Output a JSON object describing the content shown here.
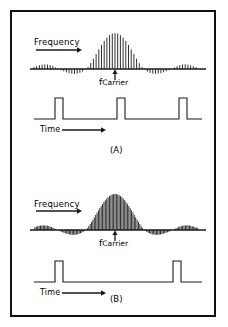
{
  "figure": {
    "border_color": "#111111",
    "trace_color": "#1a1a1a",
    "background": "#ffffff"
  },
  "panels": [
    {
      "tag": "(A)",
      "frequency_label": "Frequency",
      "time_label": "Time",
      "carrier_symbol": "f",
      "carrier_subscript": "Carrier",
      "chart_data": {
        "type": "line",
        "title": "(A) Short pulse period spectrum",
        "xlabel": "Frequency",
        "ylabel": "",
        "subcharts": [
          {
            "type": "bar",
            "name": "spectrum",
            "description": "Spectral line comb with sinc envelope centered on f Carrier",
            "line_count": 61,
            "line_spacing_px": 2.7,
            "main_lobe_peak": 1.0,
            "side_lobe_peak": -0.36,
            "envelope": "sinc",
            "baseline_y": 57,
            "carrier_x": 103,
            "x_start": 22,
            "x_end": 188
          },
          {
            "type": "line",
            "name": "pulse-train",
            "description": "Rectangular pulse train, narrow pulses, short period",
            "pulse_count": 3,
            "pulse_width_px": 8,
            "pulse_period_px": 62,
            "pulse_positions": [
              47,
              109,
              171
            ],
            "baseline_y": 107,
            "top_y": 86,
            "x_start": 22,
            "x_end": 190
          }
        ]
      }
    },
    {
      "tag": "(B)",
      "frequency_label": "Frequency",
      "time_label": "Time",
      "carrier_symbol": "f",
      "carrier_subscript": "Carrier",
      "chart_data": {
        "type": "line",
        "title": "(B) Long pulse period spectrum",
        "xlabel": "Frequency",
        "ylabel": "",
        "subcharts": [
          {
            "type": "bar",
            "name": "spectrum",
            "description": "Denser spectral line comb with sinc envelope centered on f Carrier",
            "line_count": 121,
            "line_spacing_px": 1.38,
            "main_lobe_peak": 1.0,
            "side_lobe_peak": -0.42,
            "envelope": "sinc",
            "baseline_y": 66,
            "carrier_x": 103,
            "x_start": 22,
            "x_end": 188
          },
          {
            "type": "line",
            "name": "pulse-train",
            "description": "Rectangular pulse train, narrow pulses, long period",
            "pulse_count": 2,
            "pulse_width_px": 8,
            "pulse_period_px": 118,
            "pulse_positions": [
              47,
              165
            ],
            "baseline_y": 118,
            "top_y": 97,
            "x_start": 22,
            "x_end": 190
          }
        ]
      }
    }
  ]
}
